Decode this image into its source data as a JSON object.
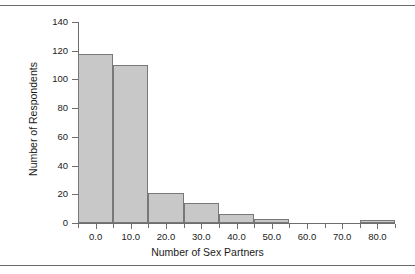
{
  "figure": {
    "background_color": "#ffffff",
    "rule_color": "#6b6b6b"
  },
  "chart_data": {
    "type": "bar",
    "title": "",
    "subtitle": "",
    "xlabel": "Number of Sex Partners",
    "ylabel": "Number of Respondents",
    "xlim": [
      -5,
      85
    ],
    "ylim": [
      0,
      140
    ],
    "grid": false,
    "legend": null,
    "bar_fill_color": "#c8c8c8",
    "bar_edge_color": "#787878",
    "bin_width": 10,
    "x_tick_labels": [
      "0.0",
      "10.0",
      "20.0",
      "30.0",
      "40.0",
      "50.0",
      "60.0",
      "70.0",
      "80.0"
    ],
    "x_tick_values": [
      0,
      10,
      20,
      30,
      40,
      50,
      60,
      70,
      80
    ],
    "x_minor_tick_values": [
      -5,
      5,
      15,
      25,
      35,
      45,
      55,
      65,
      75,
      85
    ],
    "y_tick_labels": [
      "0",
      "20",
      "40",
      "60",
      "80",
      "100",
      "120",
      "140"
    ],
    "y_tick_values": [
      0,
      20,
      40,
      60,
      80,
      100,
      120,
      140
    ],
    "categories": [
      "0.0",
      "10.0",
      "20.0",
      "30.0",
      "40.0",
      "50.0",
      "60.0",
      "70.0",
      "80.0"
    ],
    "values": [
      118,
      110,
      21,
      14,
      6,
      3,
      0,
      0,
      2
    ],
    "bars": [
      {
        "center": 0,
        "left": -5,
        "right": 5,
        "value": 118
      },
      {
        "center": 10,
        "left": 5,
        "right": 15,
        "value": 110
      },
      {
        "center": 20,
        "left": 15,
        "right": 25,
        "value": 21
      },
      {
        "center": 30,
        "left": 25,
        "right": 35,
        "value": 14
      },
      {
        "center": 40,
        "left": 35,
        "right": 45,
        "value": 6
      },
      {
        "center": 50,
        "left": 45,
        "right": 55,
        "value": 3
      },
      {
        "center": 80,
        "left": 75,
        "right": 85,
        "value": 2
      }
    ]
  }
}
